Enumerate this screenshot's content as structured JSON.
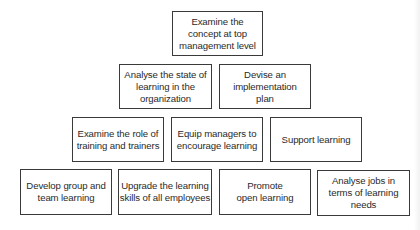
{
  "diagram": {
    "type": "pyramid-hierarchy",
    "rows": [
      {
        "level": 1,
        "nodes": [
          {
            "id": "examine-concept",
            "label": "Examine the\nconcept at top\nmanagement level"
          }
        ]
      },
      {
        "level": 2,
        "nodes": [
          {
            "id": "analyse-state",
            "label": "Analyse the state of\nlearning in the\norganization"
          },
          {
            "id": "devise-plan",
            "label": "Devise an\nimplementation\nplan"
          }
        ]
      },
      {
        "level": 3,
        "nodes": [
          {
            "id": "examine-role",
            "label": "Examine the role of\ntraining and trainers"
          },
          {
            "id": "equip-managers",
            "label": "Equip managers to\nencourage learning"
          },
          {
            "id": "support-learning",
            "label": "Support learning"
          }
        ]
      },
      {
        "level": 4,
        "nodes": [
          {
            "id": "develop-group",
            "label": "Develop group and\nteam learning"
          },
          {
            "id": "upgrade-skills",
            "label": "Upgrade the learning\nskills of all employees"
          },
          {
            "id": "promote-open",
            "label": "Promote\nopen learning"
          },
          {
            "id": "analyse-jobs",
            "label": "Analyse jobs in\nterms of learning\nneeds"
          }
        ]
      }
    ],
    "colors": {
      "border": "#3a3a3a",
      "text": "#2a2a2a",
      "background": "#ffffff"
    }
  }
}
